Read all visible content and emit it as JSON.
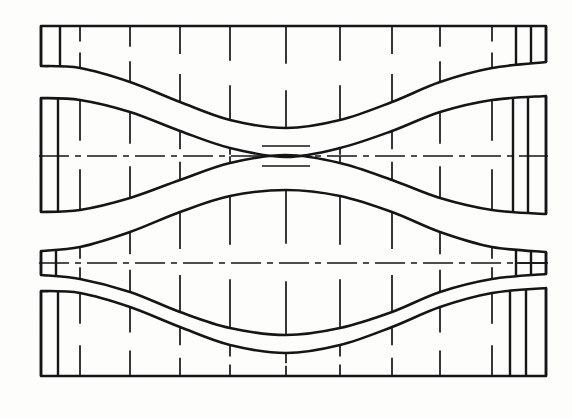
{
  "drawing": {
    "title": "Developed surface layout of a waisted sheet-metal transition",
    "type": "engineering-line-drawing",
    "canvas": {
      "width": 572,
      "height": 418
    },
    "background_color": "#fdfdfc",
    "ink_color": "#151515",
    "line_weights": {
      "outline": 2.6,
      "station": 1.7,
      "centerline": 1.7,
      "end_cell": 2.4
    },
    "band_count": 4,
    "station_line_style": "broken-vertical-tick-pair",
    "centerline_style": "dash-dot",
    "bands": [
      {
        "name": "band-1-top-strip",
        "label": "top strip",
        "left_x": 41,
        "right_x": 546,
        "top_edge": {
          "kind": "straight",
          "y": 26
        },
        "bottom_edge": {
          "kind": "wave",
          "description": "descending S-curve, high at left, low at centre, high at right",
          "points": [
            [
              41,
              66
            ],
            [
              80,
              68
            ],
            [
              130,
              82
            ],
            [
              180,
              102
            ],
            [
              230,
              120
            ],
            [
              286,
              128
            ],
            [
              340,
              120
            ],
            [
              392,
              102
            ],
            [
              440,
              82
            ],
            [
              492,
              68
            ],
            [
              546,
              62
            ]
          ]
        },
        "left_end_cells": [
          41,
          60
        ],
        "right_end_cells": [
          516,
          531,
          546
        ],
        "station_x": [
          80,
          130,
          180,
          230,
          286,
          340,
          392,
          440,
          492
        ],
        "centerline": false
      },
      {
        "name": "band-2-waisted-upper",
        "label": "waisted upper panel",
        "left_x": 41,
        "right_x": 546,
        "top_edge": {
          "kind": "wave",
          "description": "concave throat: wide at both ends, pinched at centre",
          "points": [
            [
              41,
              98
            ],
            [
              80,
              100
            ],
            [
              130,
              112
            ],
            [
              180,
              131
            ],
            [
              230,
              148
            ],
            [
              286,
              157
            ],
            [
              340,
              148
            ],
            [
              392,
              131
            ],
            [
              440,
              112
            ],
            [
              492,
              100
            ],
            [
              546,
              96
            ]
          ]
        },
        "bottom_edge": {
          "kind": "wave",
          "description": "convex mirror of top edge, pinched at centre",
          "points": [
            [
              41,
              212
            ],
            [
              80,
              210
            ],
            [
              130,
              198
            ],
            [
              180,
              180
            ],
            [
              230,
              163
            ],
            [
              286,
              155
            ],
            [
              340,
              163
            ],
            [
              392,
              180
            ],
            [
              440,
              198
            ],
            [
              492,
              210
            ],
            [
              546,
              214
            ]
          ]
        },
        "left_end_cells": [
          41,
          58
        ],
        "right_end_cells": [
          513,
          528,
          546
        ],
        "station_x": [
          80,
          130,
          180,
          230,
          262,
          286,
          310,
          340,
          392,
          440,
          492
        ],
        "centerline": true,
        "centerline_y": 156,
        "throat": {
          "x_left": 262,
          "x_right": 310,
          "half_height": 4
        }
      },
      {
        "name": "band-3-lens-lower",
        "label": "lens-shaped lower panel",
        "left_x": 41,
        "right_x": 546,
        "top_edge": {
          "kind": "wave",
          "description": "bulges upward toward centre, tapers to points at both ends",
          "points": [
            [
              41,
              251
            ],
            [
              80,
              247
            ],
            [
              130,
              232
            ],
            [
              180,
              212
            ],
            [
              230,
              196
            ],
            [
              286,
              190
            ],
            [
              340,
              196
            ],
            [
              392,
              212
            ],
            [
              440,
              232
            ],
            [
              492,
              247
            ],
            [
              546,
              252
            ]
          ]
        },
        "bottom_edge": {
          "kind": "wave",
          "description": "bulges downward toward centre, tapers to points at both ends",
          "points": [
            [
              41,
              275
            ],
            [
              80,
              279
            ],
            [
              130,
              292
            ],
            [
              180,
              312
            ],
            [
              230,
              328
            ],
            [
              286,
              335
            ],
            [
              340,
              328
            ],
            [
              392,
              312
            ],
            [
              440,
              292
            ],
            [
              492,
              279
            ],
            [
              546,
              274
            ]
          ]
        },
        "left_end_cells": [
          41,
          56
        ],
        "right_end_cells": [
          516,
          531,
          546
        ],
        "station_x": [
          80,
          130,
          180,
          230,
          286,
          340,
          392,
          440,
          492
        ],
        "centerline": true,
        "centerline_y": 263,
        "right_end_grid": {
          "x_from": 516,
          "x_to": 546,
          "rows": 2,
          "cols": 2
        }
      },
      {
        "name": "band-4-bottom-strip",
        "label": "bottom strip",
        "left_x": 41,
        "right_x": 546,
        "top_edge": {
          "kind": "wave",
          "description": "ascending S-curve, high at left, low at centre, high at right",
          "points": [
            [
              41,
              291
            ],
            [
              80,
              293
            ],
            [
              130,
              307
            ],
            [
              180,
              327
            ],
            [
              230,
              345
            ],
            [
              286,
              353
            ],
            [
              340,
              345
            ],
            [
              392,
              327
            ],
            [
              440,
              307
            ],
            [
              492,
              293
            ],
            [
              546,
              288
            ]
          ]
        },
        "bottom_edge": {
          "kind": "straight",
          "y": 376
        },
        "left_end_cells": [
          41,
          58
        ],
        "right_end_cells": [
          510,
          526,
          546
        ],
        "station_x": [
          80,
          130,
          180,
          230,
          286,
          340,
          392,
          440,
          492
        ],
        "centerline": false
      }
    ],
    "legend": {
      "outline_label": "panel outline",
      "station_label": "station / development line",
      "centerline_label": "axis (dash-dot)"
    }
  }
}
